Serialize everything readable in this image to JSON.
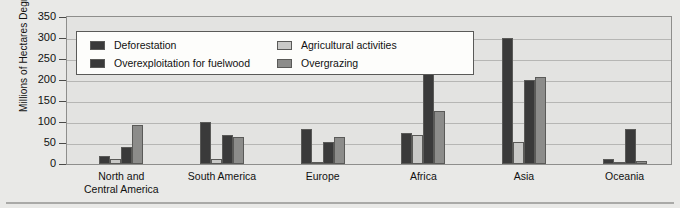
{
  "chart_data": {
    "type": "bar",
    "title": "",
    "xlabel": "",
    "ylabel": "Millions of Hectares Degraded",
    "ylim": [
      0,
      350
    ],
    "ytick_step": 50,
    "yticks": [
      350,
      300,
      250,
      200,
      150,
      100,
      50,
      0
    ],
    "grid": true,
    "legend_position": "upper-left-inside",
    "categories": [
      "North and\nCentral America",
      "South America",
      "Europe",
      "Africa",
      "Asia",
      "Oceania"
    ],
    "category_lines": [
      [
        "North and",
        "Central America"
      ],
      [
        "South America"
      ],
      [
        "Europe"
      ],
      [
        "Africa"
      ],
      [
        "Asia"
      ],
      [
        "Oceania"
      ]
    ],
    "series": [
      {
        "name": "Deforestation",
        "color": "#3a3a3a",
        "swatch_class": "swatch-deforestation",
        "values": [
          18,
          100,
          84,
          73,
          300,
          12
        ]
      },
      {
        "name": "Agricultural activities",
        "color": "#c9c9c7",
        "swatch_class": "swatch-agricultural",
        "values": [
          13,
          13,
          3,
          70,
          52,
          1
        ]
      },
      {
        "name": "Overexploitation for fuelwood",
        "color": "#3a3a3a",
        "swatch_class": "swatch-overexploitation",
        "values": [
          40,
          68,
          53,
          248,
          200,
          83
        ]
      },
      {
        "name": "Overgrazing",
        "color": "#8c8c8a",
        "swatch_class": "swatch-overgrazing",
        "values": [
          92,
          64,
          65,
          126,
          207,
          8
        ]
      }
    ],
    "legend_order": [
      0,
      2,
      1,
      3
    ]
  }
}
